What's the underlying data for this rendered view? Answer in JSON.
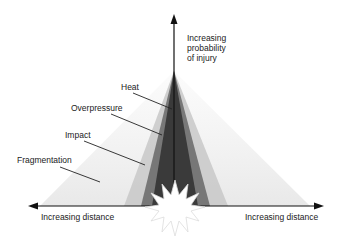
{
  "diagram": {
    "y_axis_label": [
      "Increasing",
      "probability",
      "of injury"
    ],
    "x_axis_left_label": "Increasing distance",
    "x_axis_right_label": "Increasing distance",
    "zones": [
      {
        "name": "Heat",
        "shade": "#2a2a2a"
      },
      {
        "name": "Overpressure",
        "shade": "#555555"
      },
      {
        "name": "Impact",
        "shade": "#9a9a9a"
      },
      {
        "name": "Fragmentation",
        "shade": "#e4e4e4"
      }
    ],
    "source": "explosion-starburst"
  }
}
